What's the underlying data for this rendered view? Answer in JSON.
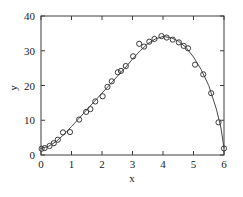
{
  "chart_data": {
    "type": "scatter",
    "title": "",
    "subtitle": "",
    "xlabel": "x",
    "ylabel": "y",
    "xlim": [
      0,
      6
    ],
    "ylim": [
      0,
      40
    ],
    "xticks": [
      0,
      1,
      2,
      3,
      4,
      5,
      6
    ],
    "yticks": [
      0,
      10,
      20,
      30,
      40
    ],
    "xticklabels": [
      "0",
      "1",
      "2",
      "3",
      "4",
      "5",
      "6"
    ],
    "yticklabels": [
      "0",
      "10",
      "20",
      "30",
      "40"
    ],
    "grid": false,
    "legend": null,
    "legend_position": "none",
    "frame": "box",
    "tick_direction": "in",
    "marker_style": "open-circle",
    "marker_color": "#3a3a3a",
    "line_color": "#44484c",
    "background_color": "#ffffff",
    "series": [
      {
        "name": "data points",
        "type": "scatter",
        "marker": "o",
        "points": [
          {
            "x": 0.02,
            "y": 1.8
          },
          {
            "x": 0.12,
            "y": 2.0
          },
          {
            "x": 0.28,
            "y": 2.6
          },
          {
            "x": 0.42,
            "y": 3.4
          },
          {
            "x": 0.55,
            "y": 4.4
          },
          {
            "x": 0.72,
            "y": 6.5
          },
          {
            "x": 0.95,
            "y": 6.6
          },
          {
            "x": 1.25,
            "y": 10.2
          },
          {
            "x": 1.48,
            "y": 12.4
          },
          {
            "x": 1.62,
            "y": 13.2
          },
          {
            "x": 1.78,
            "y": 15.4
          },
          {
            "x": 2.02,
            "y": 16.9
          },
          {
            "x": 2.18,
            "y": 19.6
          },
          {
            "x": 2.32,
            "y": 21.2
          },
          {
            "x": 2.52,
            "y": 23.8
          },
          {
            "x": 2.62,
            "y": 24.2
          },
          {
            "x": 2.78,
            "y": 25.6
          },
          {
            "x": 3.02,
            "y": 28.4
          },
          {
            "x": 3.22,
            "y": 32.0
          },
          {
            "x": 3.38,
            "y": 31.2
          },
          {
            "x": 3.55,
            "y": 32.6
          },
          {
            "x": 3.72,
            "y": 33.4
          },
          {
            "x": 3.95,
            "y": 34.2
          },
          {
            "x": 4.12,
            "y": 33.8
          },
          {
            "x": 4.32,
            "y": 33.2
          },
          {
            "x": 4.52,
            "y": 32.4
          },
          {
            "x": 4.68,
            "y": 31.4
          },
          {
            "x": 4.82,
            "y": 30.7
          },
          {
            "x": 5.05,
            "y": 26.0
          },
          {
            "x": 5.32,
            "y": 23.2
          },
          {
            "x": 5.58,
            "y": 17.8
          },
          {
            "x": 5.82,
            "y": 9.4
          },
          {
            "x": 6.0,
            "y": 1.9
          }
        ]
      },
      {
        "name": "fitted curve",
        "type": "line",
        "points": [
          {
            "x": 0.0,
            "y": 1.9
          },
          {
            "x": 0.25,
            "y": 2.5
          },
          {
            "x": 0.5,
            "y": 3.9
          },
          {
            "x": 0.75,
            "y": 5.9
          },
          {
            "x": 1.0,
            "y": 8.2
          },
          {
            "x": 1.25,
            "y": 10.6
          },
          {
            "x": 1.5,
            "y": 13.0
          },
          {
            "x": 1.75,
            "y": 15.4
          },
          {
            "x": 2.0,
            "y": 17.8
          },
          {
            "x": 2.25,
            "y": 20.2
          },
          {
            "x": 2.5,
            "y": 22.6
          },
          {
            "x": 2.75,
            "y": 25.0
          },
          {
            "x": 3.0,
            "y": 27.6
          },
          {
            "x": 3.25,
            "y": 30.0
          },
          {
            "x": 3.5,
            "y": 32.0
          },
          {
            "x": 3.75,
            "y": 33.4
          },
          {
            "x": 4.0,
            "y": 34.1
          },
          {
            "x": 4.25,
            "y": 33.8
          },
          {
            "x": 4.5,
            "y": 32.8
          },
          {
            "x": 4.75,
            "y": 31.0
          },
          {
            "x": 5.0,
            "y": 28.2
          },
          {
            "x": 5.25,
            "y": 24.6
          },
          {
            "x": 5.5,
            "y": 20.0
          },
          {
            "x": 5.75,
            "y": 13.2
          },
          {
            "x": 5.9,
            "y": 7.8
          },
          {
            "x": 6.0,
            "y": 2.0
          }
        ]
      }
    ]
  }
}
